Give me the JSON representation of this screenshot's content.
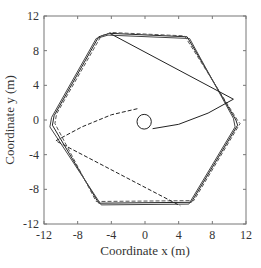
{
  "chart_data": {
    "type": "line",
    "title": "",
    "xlabel": "Coordinate x (m)",
    "ylabel": "Coordinate y (m)",
    "xlim": [
      -12,
      12
    ],
    "ylim": [
      -12,
      12
    ],
    "xticks": [
      -12,
      -8,
      -4,
      0,
      4,
      8,
      12
    ],
    "yticks": [
      -12,
      -8,
      -4,
      0,
      4,
      8,
      12
    ],
    "xtick_labels": [
      "-12",
      "-8",
      "-4",
      "0",
      "4",
      "8",
      "12"
    ],
    "ytick_labels": [
      "-12",
      "-8",
      "-4",
      "0",
      "4",
      "8",
      "12"
    ],
    "grid": false,
    "legend": null,
    "series": [
      {
        "name": "hexagon-path-solid",
        "style": "solid",
        "color": "#222222",
        "points": [
          [
            -5.5,
            9.6
          ],
          [
            -4.2,
            10.0
          ],
          [
            5.0,
            9.6
          ],
          [
            10.8,
            0.0
          ],
          [
            11.0,
            -0.6
          ],
          [
            5.5,
            -9.5
          ],
          [
            -5.5,
            -9.6
          ],
          [
            -11.0,
            -0.6
          ],
          [
            -10.8,
            0.5
          ],
          [
            -5.5,
            9.6
          ]
        ]
      },
      {
        "name": "hexagon-path-offset-1",
        "style": "solid",
        "color": "#444444",
        "points": [
          [
            -5.8,
            9.4
          ],
          [
            -4.4,
            9.8
          ],
          [
            5.3,
            9.4
          ],
          [
            10.5,
            0.2
          ],
          [
            10.7,
            -0.8
          ],
          [
            5.2,
            -9.7
          ],
          [
            -5.2,
            -9.8
          ],
          [
            -11.3,
            -0.8
          ],
          [
            -11.1,
            0.3
          ],
          [
            -5.8,
            9.4
          ]
        ]
      },
      {
        "name": "hexagon-path-offset-2",
        "style": "dashed",
        "color": "#555555",
        "points": [
          [
            -5.2,
            9.7
          ],
          [
            -4.0,
            10.1
          ],
          [
            4.7,
            9.7
          ],
          [
            11.1,
            -0.2
          ],
          [
            11.3,
            -0.4
          ],
          [
            5.8,
            -9.3
          ],
          [
            -5.8,
            -9.4
          ],
          [
            -10.7,
            -0.4
          ],
          [
            -10.5,
            0.7
          ],
          [
            -5.2,
            9.7
          ]
        ]
      },
      {
        "name": "approach-solid",
        "style": "solid",
        "color": "#222222",
        "points": [
          [
            0.9,
            -1.0
          ],
          [
            4.0,
            -0.5
          ],
          [
            7.5,
            0.8
          ],
          [
            10.5,
            2.4
          ],
          [
            -4.2,
            10.0
          ]
        ]
      },
      {
        "name": "approach-dashed",
        "style": "dashed",
        "color": "#222222",
        "points": [
          [
            -0.9,
            1.3
          ],
          [
            -4.0,
            0.6
          ],
          [
            -7.5,
            -0.8
          ],
          [
            -10.6,
            -2.4
          ],
          [
            4.2,
            -9.9
          ]
        ]
      },
      {
        "name": "initial-circle",
        "style": "solid",
        "color": "#222222",
        "center": [
          -0.1,
          -0.2
        ],
        "radius": 0.85
      }
    ]
  },
  "axes": {
    "xlabel": "Coordinate x (m)",
    "ylabel": "Coordinate y (m)",
    "xtick_labels": [
      "-12",
      "-8",
      "-4",
      "0",
      "4",
      "8",
      "12"
    ],
    "ytick_labels": [
      "12",
      "8",
      "4",
      "0",
      "-4",
      "-8",
      "-12"
    ]
  }
}
